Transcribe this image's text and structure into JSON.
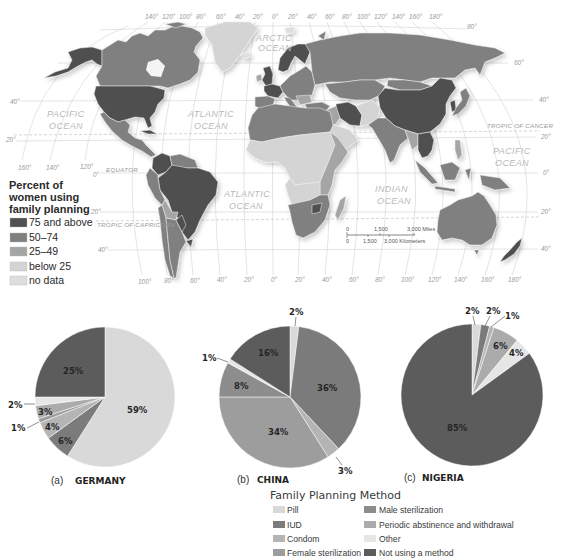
{
  "map": {
    "legend": {
      "title_lines": [
        "Percent of",
        "women using",
        "family planning"
      ],
      "items": [
        {
          "label": "75 and above",
          "color": "#505050"
        },
        {
          "label": "50–74",
          "color": "#808080"
        },
        {
          "label": "25–49",
          "color": "#a5a5a5"
        },
        {
          "label": "below 25",
          "color": "#d4d4d4"
        },
        {
          "label": "no data",
          "color": "#dedede"
        }
      ]
    },
    "oceans": {
      "arctic": [
        "ARCTIC",
        "OCEAN"
      ],
      "pacific_west": [
        "PACIFIC",
        "OCEAN"
      ],
      "atlantic_north": [
        "ATLANTIC",
        "OCEAN"
      ],
      "atlantic_south": [
        "ATLANTIC",
        "OCEAN"
      ],
      "indian": [
        "INDIAN",
        "OCEAN"
      ],
      "pacific_east": [
        "PACIFIC",
        "OCEAN"
      ]
    },
    "lines": {
      "equator": "EQUATOR",
      "tropic_cancer": "TROPIC OF CANCER",
      "tropic_capricorn": "TROPIC OF CAPRICORN"
    },
    "longitude_top": [
      "140°",
      "120°",
      "100°",
      "80°",
      "60°",
      "40°",
      "20°",
      "0°",
      "20°",
      "40°",
      "60°",
      "80°",
      "100°",
      "120°",
      "140°",
      "160°",
      "180°"
    ],
    "longitude_left": [
      "160°",
      "140°",
      "120°"
    ],
    "longitude_bottom": [
      "100°",
      "80°",
      "60°",
      "40°",
      "20°",
      "0°",
      "20°",
      "40°",
      "60°",
      "80°",
      "100°",
      "120°",
      "140°",
      "160°",
      "180°"
    ],
    "latitude_left": [
      "40°",
      "20°",
      "0°",
      "20°",
      "40°"
    ],
    "latitude_right": [
      "80°",
      "60°",
      "40°",
      "20°",
      "0°",
      "20°",
      "40°"
    ],
    "scale_bar": {
      "miles": [
        "0",
        "1,500",
        "3,000 Miles"
      ],
      "km": [
        "0",
        "1,500",
        "3,000 Kilometers"
      ]
    }
  },
  "legend": {
    "title": "Family Planning Method",
    "items": [
      {
        "label": "Pill",
        "color": "#d9d9d9"
      },
      {
        "label": "IUD",
        "color": "#7b7b7b"
      },
      {
        "label": "Condom",
        "color": "#b4b4b4"
      },
      {
        "label": "Female sterilization",
        "color": "#9d9d9d"
      },
      {
        "label": "Male sterilization",
        "color": "#8d8d8d"
      },
      {
        "label": "Periodic abstinence and withdrawal",
        "color": "#ababab"
      },
      {
        "label": "Other",
        "color": "#e6e6e6"
      },
      {
        "label": "Not using a method",
        "color": "#5c5c5c"
      }
    ]
  },
  "chart_data": [
    {
      "type": "pie",
      "panel": "(a)",
      "title": "GERMANY",
      "slices": [
        {
          "category": "Pill",
          "value": 59,
          "label": "59%"
        },
        {
          "category": "IUD",
          "value": 6,
          "label": "6%"
        },
        {
          "category": "Condom",
          "value": 4,
          "label": "4%"
        },
        {
          "category": "Female sterilization",
          "value": 1,
          "label": "1%"
        },
        {
          "category": "Periodic abstinence and withdrawal",
          "value": 3,
          "label": "3%"
        },
        {
          "category": "Other",
          "value": 2,
          "label": "2%"
        },
        {
          "category": "Not using a method",
          "value": 25,
          "label": "25%"
        }
      ]
    },
    {
      "type": "pie",
      "panel": "(b)",
      "title": "CHINA",
      "slices": [
        {
          "category": "Pill",
          "value": 2,
          "label": "2%"
        },
        {
          "category": "IUD",
          "value": 36,
          "label": "36%"
        },
        {
          "category": "Condom",
          "value": 3,
          "label": "3%"
        },
        {
          "category": "Female sterilization",
          "value": 34,
          "label": "34%"
        },
        {
          "category": "Male sterilization",
          "value": 8,
          "label": "8%"
        },
        {
          "category": "Other",
          "value": 1,
          "label": "1%"
        },
        {
          "category": "Not using a method",
          "value": 16,
          "label": "16%"
        }
      ]
    },
    {
      "type": "pie",
      "panel": "(c)",
      "title": "NIGERIA",
      "slices": [
        {
          "category": "Pill",
          "value": 2,
          "label": "2%"
        },
        {
          "category": "IUD",
          "value": 2,
          "label": "2%"
        },
        {
          "category": "Condom",
          "value": 1,
          "label": "1%"
        },
        {
          "category": "Periodic abstinence and withdrawal",
          "value": 6,
          "label": "6%"
        },
        {
          "category": "Other",
          "value": 4,
          "label": "4%"
        },
        {
          "category": "Not using a method",
          "value": 85,
          "label": "85%"
        }
      ]
    }
  ]
}
